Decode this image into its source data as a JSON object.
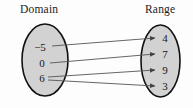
{
  "figure": {
    "title_left": "Domain",
    "title_right": "Range",
    "colors": {
      "oval_fill": "#d2d2d2",
      "oval_stroke": "#111111",
      "arrow": "#555555",
      "text": "#161616",
      "background": "#fdfdfd"
    }
  },
  "domain": {
    "label": "Domain",
    "values": [
      {
        "text": "−5",
        "x": 40,
        "y": 47
      },
      {
        "text": "0",
        "x": 42,
        "y": 63
      },
      {
        "text": "6",
        "x": 42,
        "y": 78
      }
    ]
  },
  "range": {
    "label": "Range",
    "values": [
      {
        "text": "4",
        "x": 165,
        "y": 38
      },
      {
        "text": "7",
        "x": 165,
        "y": 54
      },
      {
        "text": "9",
        "x": 165,
        "y": 70
      },
      {
        "text": "3",
        "x": 165,
        "y": 86
      }
    ]
  },
  "mappings": [
    {
      "from": "−5",
      "to": "4",
      "x1": 52,
      "y1": 46,
      "x2": 155,
      "y2": 38
    },
    {
      "from": "0",
      "to": "7",
      "x1": 50,
      "y1": 63,
      "x2": 155,
      "y2": 54
    },
    {
      "from": "6",
      "to": "9",
      "x1": 48,
      "y1": 77,
      "x2": 155,
      "y2": 70
    },
    {
      "from": "6",
      "to": "3",
      "x1": 48,
      "y1": 80,
      "x2": 155,
      "y2": 86
    }
  ],
  "ovals": {
    "domain": {
      "cx": 45,
      "cy": 60,
      "rx": 23,
      "ry": 36
    },
    "range": {
      "cx": 160.5,
      "cy": 61,
      "rx": 19.5,
      "ry": 36
    }
  }
}
